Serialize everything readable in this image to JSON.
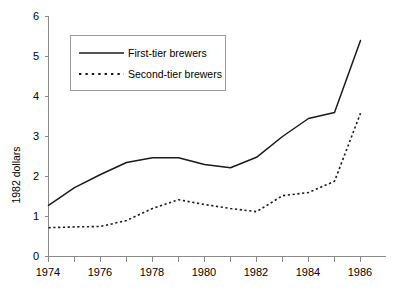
{
  "chart_data": {
    "type": "line",
    "title": "",
    "subtitle": "",
    "xlabel": "",
    "ylabel": "1982 dollars",
    "xlim": [
      1973.5,
      1986.5
    ],
    "ylim": [
      0,
      6
    ],
    "grid": false,
    "legend_position": "top-left",
    "x_tick_labels": [
      "1974",
      "1976",
      "1978",
      "1980",
      "1982",
      "1984",
      "1986"
    ],
    "x_tick_values": [
      1974,
      1976,
      1978,
      1980,
      1982,
      1984,
      1986
    ],
    "x_minor_ticks": [
      1975,
      1977,
      1979,
      1981,
      1983,
      1985
    ],
    "y_tick_labels": [
      "0",
      "1",
      "2",
      "3",
      "4",
      "5",
      "6"
    ],
    "y_tick_values": [
      0,
      1,
      2,
      3,
      4,
      5,
      6
    ],
    "x": [
      1974,
      1975,
      1976,
      1977,
      1978,
      1979,
      1980,
      1981,
      1982,
      1983,
      1984,
      1985,
      1986
    ],
    "series": [
      {
        "name": "First-tier brewers",
        "style": "solid",
        "color": "#1a1a1a",
        "values": [
          1.28,
          1.72,
          2.05,
          2.35,
          2.47,
          2.47,
          2.3,
          2.22,
          2.48,
          3.0,
          3.45,
          3.6,
          5.4
        ]
      },
      {
        "name": "Second-tier brewers",
        "style": "dotted",
        "color": "#1a1a1a",
        "values": [
          0.72,
          0.74,
          0.75,
          0.9,
          1.2,
          1.42,
          1.3,
          1.2,
          1.12,
          1.52,
          1.6,
          1.88,
          3.58
        ]
      }
    ]
  },
  "legend": {
    "entries": [
      {
        "label": "First-tier brewers",
        "style": "solid"
      },
      {
        "label": "Second-tier brewers",
        "style": "dotted"
      }
    ]
  },
  "axes": {
    "y_axis_title": "1982 dollars"
  }
}
